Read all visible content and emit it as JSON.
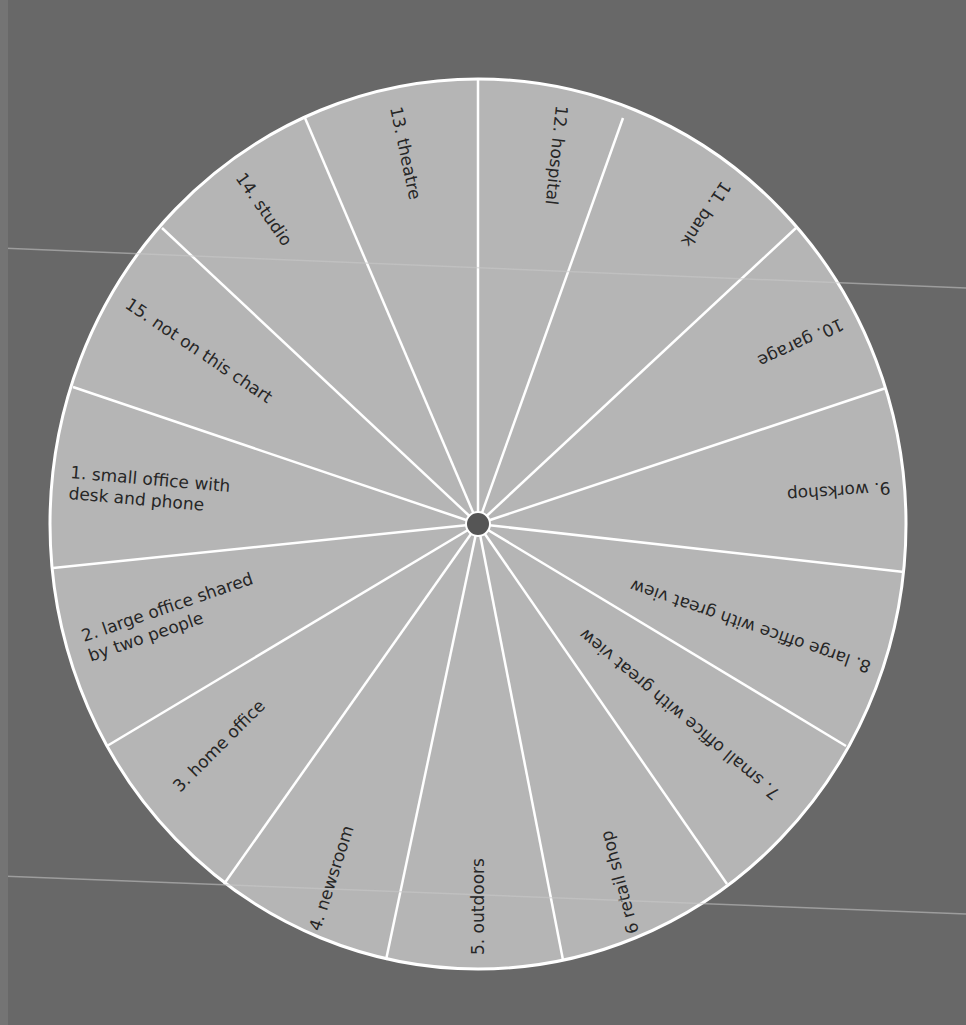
{
  "colors": {
    "background": "#686868",
    "wheel_fill": "#b5b5b5",
    "divider": "#ffffff",
    "hub": "#555555",
    "text": "#262626",
    "scan_line": "#c8c8c8"
  },
  "wheel": {
    "center": [
      478,
      524
    ],
    "rx": 428,
    "ry": 445,
    "hub_radius": 12,
    "sectors": [
      {
        "id": 1,
        "lines": [
          "1.  small office with",
          "desk and phone"
        ],
        "x": 70,
        "y": 478,
        "rot": 5
      },
      {
        "id": 2,
        "lines": [
          "2.  large office shared",
          "by two people"
        ],
        "x": 84,
        "y": 642,
        "rot": -19
      },
      {
        "id": 3,
        "lines": [
          "3.  home office"
        ],
        "x": 180,
        "y": 793,
        "rot": -45
      },
      {
        "id": 4,
        "lines": [
          "4.  newsroom"
        ],
        "x": 320,
        "y": 932,
        "rot": -72
      },
      {
        "id": 5,
        "lines": [
          "5.  outdoors"
        ],
        "x": 484,
        "y": 955,
        "rot": -90
      },
      {
        "id": 6,
        "lines": [
          "6  retail shop"
        ],
        "x": 639,
        "y": 932,
        "rot": 255
      },
      {
        "id": 7,
        "lines": [
          "7.  small office with great view"
        ],
        "x": 781,
        "y": 792,
        "rot": 220
      },
      {
        "id": 8,
        "lines": [
          "8.  large office with great view"
        ],
        "x": 872,
        "y": 662,
        "rot": 199
      },
      {
        "id": 9,
        "lines": [
          "9.  workshop"
        ],
        "x": 890,
        "y": 482,
        "rot": 176
      },
      {
        "id": 10,
        "lines": [
          "10.  garage"
        ],
        "x": 840,
        "y": 318,
        "rot": 155
      },
      {
        "id": 11,
        "lines": [
          "11.  bank"
        ],
        "x": 722,
        "y": 180,
        "rot": 124
      },
      {
        "id": 12,
        "lines": [
          "12.  hospital"
        ],
        "x": 556,
        "y": 105,
        "rot": 96
      },
      {
        "id": 13,
        "lines": [
          "13.  theatre"
        ],
        "x": 390,
        "y": 108,
        "rot": 78
      },
      {
        "id": 14,
        "lines": [
          "14.  studio"
        ],
        "x": 235,
        "y": 178,
        "rot": 55
      },
      {
        "id": 15,
        "lines": [
          "15.  not on this chart"
        ],
        "x": 124,
        "y": 307,
        "rot": 34
      }
    ],
    "spoke_ends": [
      [
        478,
        79
      ],
      [
        623,
        118
      ],
      [
        796,
        228
      ],
      [
        886,
        388
      ],
      [
        904,
        572
      ],
      [
        846,
        746
      ],
      [
        727,
        884
      ],
      [
        563,
        960
      ],
      [
        386,
        960
      ],
      [
        224,
        884
      ],
      [
        107,
        746
      ],
      [
        53,
        568
      ],
      [
        73,
        387
      ],
      [
        162,
        228
      ],
      [
        305,
        118
      ]
    ]
  },
  "scan_lines": [
    {
      "x1": 0,
      "y1": 248,
      "x2": 966,
      "y2": 288
    },
    {
      "x1": 0,
      "y1": 876,
      "x2": 966,
      "y2": 914
    }
  ]
}
